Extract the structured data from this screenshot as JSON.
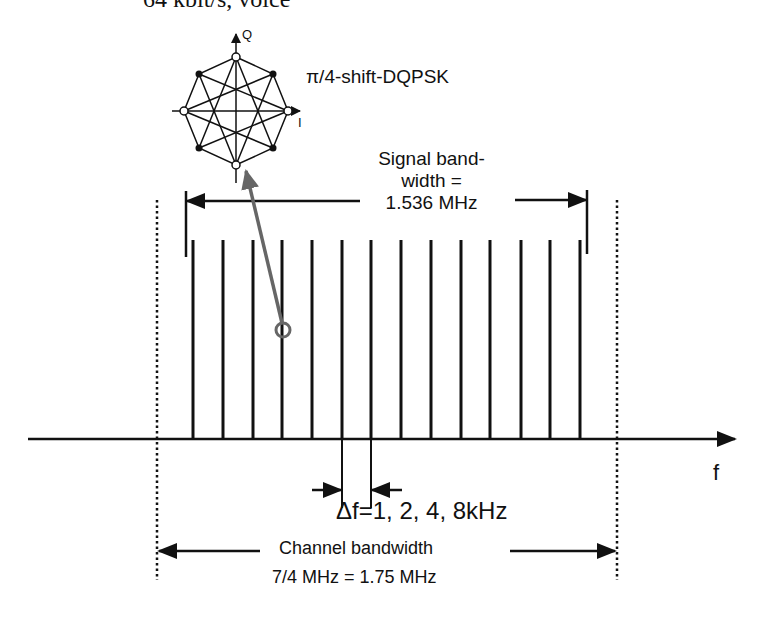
{
  "diagram": {
    "title": "64 kbit/s, voice",
    "modulation_label": "π/4-shift-DQPSK",
    "constellation": {
      "axis_q_label": "Q",
      "axis_i_label": "I",
      "open_points": [
        "top",
        "right",
        "bottom",
        "left"
      ],
      "filled_points": [
        "upper-right",
        "lower-right",
        "lower-left",
        "upper-left"
      ]
    },
    "signal_bandwidth": {
      "line1": "Signal band-",
      "line2": "width =",
      "line3": "1.536 MHz"
    },
    "subcarrier_spacing_label": "Δf=1, 2, 4, 8kHz",
    "frequency_axis_label": "f",
    "channel_bandwidth": {
      "line1": "Channel bandwidth",
      "line2": "7/4 MHz = 1.75 MHz"
    },
    "subcarrier_count_shown": 14,
    "colors": {
      "lines": "#111111",
      "pointer_arrow": "#666666"
    }
  }
}
